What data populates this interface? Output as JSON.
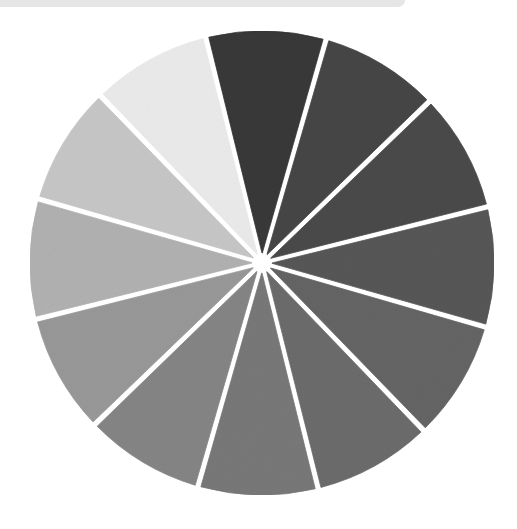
{
  "image": {
    "description": "Hand-painted grayscale value wheel with 12 wedge-shaped sectors separated by white gaps",
    "background": "#ffffff",
    "top_strip_color": "#e6e6e6"
  },
  "wheel": {
    "center": [
      262,
      263
    ],
    "radius": 232,
    "gap_width": 6,
    "start_angle_deg": -104,
    "sectors": [
      {
        "name": "value-1-darkest",
        "color": "#3a3a3a"
      },
      {
        "name": "value-2",
        "color": "#474747"
      },
      {
        "name": "value-3",
        "color": "#4c4c4c"
      },
      {
        "name": "value-4",
        "color": "#595959"
      },
      {
        "name": "value-5",
        "color": "#666666"
      },
      {
        "name": "value-6",
        "color": "#6d6d6d"
      },
      {
        "name": "value-7",
        "color": "#797979"
      },
      {
        "name": "value-8",
        "color": "#868686"
      },
      {
        "name": "value-9",
        "color": "#9a9a9a"
      },
      {
        "name": "value-10",
        "color": "#b2b2b2"
      },
      {
        "name": "value-11",
        "color": "#c8c8c8"
      },
      {
        "name": "value-12-lightest",
        "color": "#ececec"
      }
    ]
  }
}
